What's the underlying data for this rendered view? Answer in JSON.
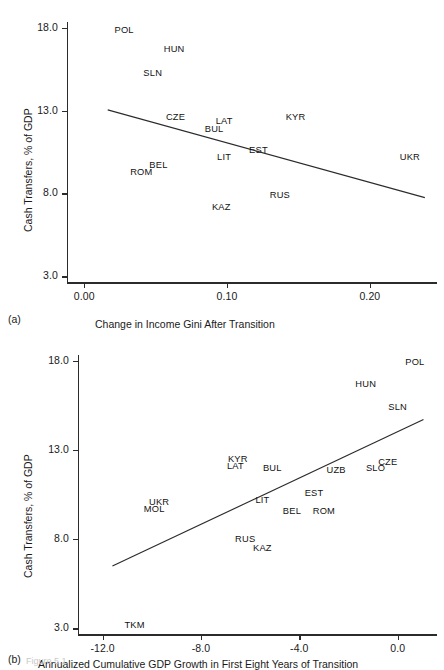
{
  "figure": {
    "caption": "Figure 5.1",
    "panels": [
      {
        "tag": "(a)"
      },
      {
        "tag": "(b)"
      }
    ]
  },
  "chart_data": [
    {
      "type": "scatter",
      "panel": "(a)",
      "title": "",
      "xlabel": "Change in Income Gini After Transition",
      "ylabel": "Cash Transfers, % of GDP",
      "xlim": [
        -0.012,
        0.247
      ],
      "ylim": [
        2.35,
        18.6
      ],
      "xticks": [
        0.0,
        0.1,
        0.2
      ],
      "xticklabels": [
        "0.00",
        "0.10",
        "0.20"
      ],
      "yticks": [
        3.0,
        8.0,
        13.0,
        18.0
      ],
      "yticklabels": [
        "3.0",
        "8.0",
        "13.0",
        "18.0"
      ],
      "grid": false,
      "legend": "none",
      "point_label_mode": "text-only",
      "points": [
        {
          "label": "POL",
          "x": 0.028,
          "y": 17.9
        },
        {
          "label": "HUN",
          "x": 0.063,
          "y": 16.7
        },
        {
          "label": "SLN",
          "x": 0.048,
          "y": 15.3
        },
        {
          "label": "CZE",
          "x": 0.064,
          "y": 12.6
        },
        {
          "label": "LAT",
          "x": 0.098,
          "y": 12.4
        },
        {
          "label": "BUL",
          "x": 0.091,
          "y": 11.9
        },
        {
          "label": "KYR",
          "x": 0.148,
          "y": 12.6
        },
        {
          "label": "EST",
          "x": 0.122,
          "y": 10.6
        },
        {
          "label": "LIT",
          "x": 0.098,
          "y": 10.2
        },
        {
          "label": "BEL",
          "x": 0.052,
          "y": 9.7
        },
        {
          "label": "ROM",
          "x": 0.04,
          "y": 9.3
        },
        {
          "label": "UKR",
          "x": 0.228,
          "y": 10.2
        },
        {
          "label": "RUS",
          "x": 0.137,
          "y": 7.9
        },
        {
          "label": "KAZ",
          "x": 0.096,
          "y": 7.2
        }
      ],
      "trendline": {
        "x0": 0.0165,
        "y0": 13.05,
        "x1": 0.2385,
        "y1": 7.75,
        "slope_sign": "negative"
      }
    },
    {
      "type": "scatter",
      "panel": "(b)",
      "title": "",
      "xlabel": "Annualized Cumulative GDP Growth in First Eight Years of Transition",
      "ylabel": "Cash Transfers, % of GDP",
      "xlim": [
        -13.0,
        1.6
      ],
      "ylim": [
        2.35,
        18.6
      ],
      "xticks": [
        -12.0,
        -8.0,
        -4.0,
        0.0
      ],
      "xticklabels": [
        "-12.0",
        "-8.0",
        "-4.0",
        "0.0"
      ],
      "yticks": [
        3.0,
        8.0,
        13.0,
        18.0
      ],
      "yticklabels": [
        "3.0",
        "8.0",
        "13.0",
        "18.0"
      ],
      "grid": false,
      "legend": "none",
      "point_label_mode": "text-only",
      "points": [
        {
          "label": "POL",
          "x": 0.7,
          "y": 17.9
        },
        {
          "label": "HUN",
          "x": -1.3,
          "y": 16.7
        },
        {
          "label": "SLN",
          "x": 0.0,
          "y": 15.4
        },
        {
          "label": "CZE",
          "x": -0.4,
          "y": 12.3
        },
        {
          "label": "SLO",
          "x": -0.9,
          "y": 12.0
        },
        {
          "label": "UZB",
          "x": -2.5,
          "y": 11.9
        },
        {
          "label": "KYR",
          "x": -6.5,
          "y": 12.5
        },
        {
          "label": "LAT",
          "x": -6.6,
          "y": 12.1
        },
        {
          "label": "BUL",
          "x": -5.1,
          "y": 12.0
        },
        {
          "label": "EST",
          "x": -3.4,
          "y": 10.6
        },
        {
          "label": "LIT",
          "x": -5.5,
          "y": 10.2
        },
        {
          "label": "BEL",
          "x": -4.3,
          "y": 9.6
        },
        {
          "label": "ROM",
          "x": -3.0,
          "y": 9.6
        },
        {
          "label": "UKR",
          "x": -9.7,
          "y": 10.1
        },
        {
          "label": "MOL",
          "x": -9.9,
          "y": 9.7
        },
        {
          "label": "RUS",
          "x": -6.2,
          "y": 8.0
        },
        {
          "label": "KAZ",
          "x": -5.5,
          "y": 7.5
        },
        {
          "label": "TKM",
          "x": -10.7,
          "y": 3.2
        }
      ],
      "trendline": {
        "x0": -11.6,
        "y0": 6.5,
        "x1": 1.05,
        "y1": 14.7,
        "slope_sign": "positive"
      }
    }
  ]
}
